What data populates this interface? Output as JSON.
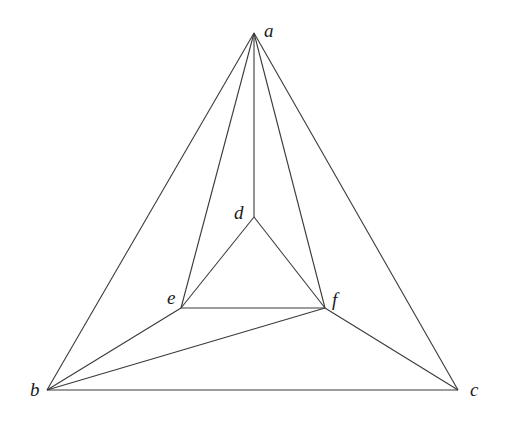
{
  "diagram": {
    "type": "planar-graph",
    "vertices": [
      {
        "id": "a",
        "label": "a",
        "x": 254,
        "y": 33,
        "lx": 264,
        "ly": 37
      },
      {
        "id": "b",
        "label": "b",
        "x": 47,
        "y": 390,
        "lx": 30,
        "ly": 396
      },
      {
        "id": "c",
        "label": "c",
        "x": 458,
        "y": 390,
        "lx": 470,
        "ly": 396
      },
      {
        "id": "d",
        "label": "d",
        "x": 254,
        "y": 217,
        "lx": 234,
        "ly": 219
      },
      {
        "id": "e",
        "label": "e",
        "x": 181,
        "y": 308,
        "lx": 167,
        "ly": 304
      },
      {
        "id": "f",
        "label": "f",
        "x": 325,
        "y": 308,
        "lx": 332,
        "ly": 306
      }
    ],
    "edges": [
      [
        "a",
        "b"
      ],
      [
        "a",
        "c"
      ],
      [
        "b",
        "c"
      ],
      [
        "a",
        "d"
      ],
      [
        "a",
        "e"
      ],
      [
        "a",
        "f"
      ],
      [
        "d",
        "e"
      ],
      [
        "d",
        "f"
      ],
      [
        "e",
        "f"
      ],
      [
        "b",
        "e"
      ],
      [
        "b",
        "f"
      ],
      [
        "c",
        "f"
      ]
    ],
    "colors": {
      "edge": "#3a3a3a",
      "label": "#1a1a1a",
      "background": "#ffffff"
    }
  }
}
